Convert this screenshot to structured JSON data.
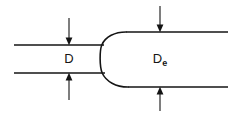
{
  "diagram": {
    "background_color": "#ffffff",
    "stroke_color": "#151515",
    "labels": {
      "inlet_diameter": "D",
      "exit_diameter_base": "D",
      "exit_diameter_subscript": "e"
    },
    "dimensions": [
      {
        "name": "inlet-diameter",
        "label": "D",
        "x": 69,
        "top_line_y": 45,
        "bottom_line_y": 73,
        "arrow_direction_top": "down",
        "arrow_direction_bottom": "up"
      },
      {
        "name": "exit-diameter",
        "label": "De",
        "x": 160,
        "top_line_y": 32,
        "bottom_line_y": 87,
        "arrow_direction_top": "down",
        "arrow_direction_bottom": "up"
      }
    ],
    "geometry": {
      "inlet_top_line": {
        "x1": 14,
        "y1": 45,
        "x2": 104,
        "y2": 45
      },
      "inlet_bottom_line": {
        "x1": 14,
        "y1": 73,
        "x2": 105,
        "y2": 73
      },
      "exit_top_line": {
        "x1": 126,
        "y1": 32,
        "x2": 228,
        "y2": 32
      },
      "exit_bottom_line": {
        "x1": 128,
        "y1": 87,
        "x2": 228,
        "y2": 87
      },
      "nose": {
        "shape": "u-curve-open-right",
        "leftmost_x": 101,
        "center_y": 59,
        "top_junction": {
          "x": 126,
          "y": 32
        },
        "bottom_junction": {
          "x": 128,
          "y": 87
        }
      }
    }
  }
}
